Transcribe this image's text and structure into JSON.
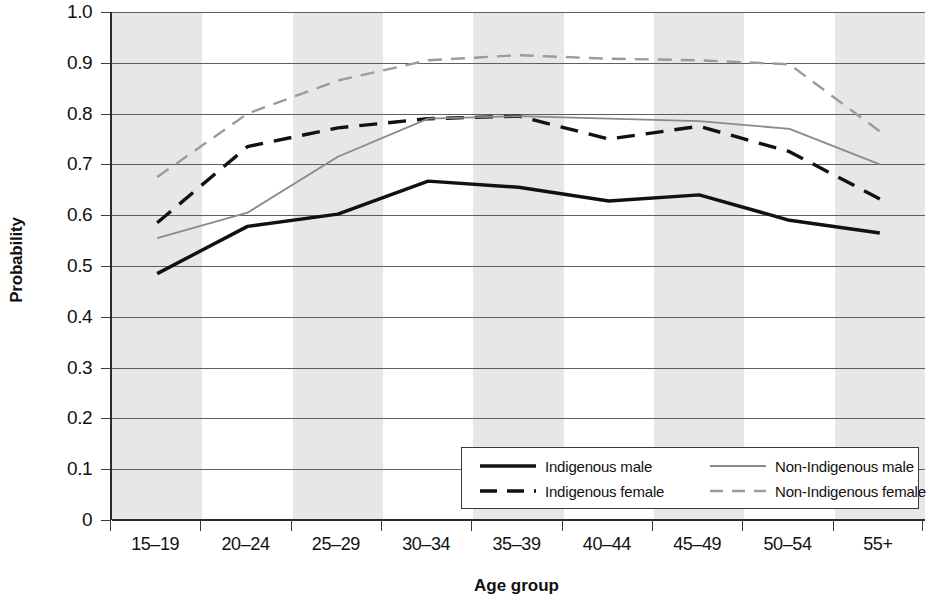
{
  "chart_data": {
    "type": "line",
    "title": "",
    "xlabel": "Age group",
    "ylabel": "Probability",
    "ylim": [
      0,
      1.0
    ],
    "ytick_labels": [
      "1.0",
      "0.9",
      "0.8",
      "0.7",
      "0.6",
      "0.5",
      "0.4",
      "0.3",
      "0.2",
      "0.1",
      "0"
    ],
    "ytick_values": [
      1.0,
      0.9,
      0.8,
      0.7,
      0.6,
      0.5,
      0.4,
      0.3,
      0.2,
      0.1,
      0
    ],
    "grid": true,
    "banded_background": true,
    "legend_position": "bottom-right",
    "categories": [
      "15–19",
      "20–24",
      "25–29",
      "30–34",
      "35–39",
      "40–44",
      "45–49",
      "50–54",
      "55+"
    ],
    "series": [
      {
        "name": "Indigenous male",
        "color": "#111111",
        "style": "solid",
        "width": 3.4,
        "values": [
          0.485,
          0.578,
          0.602,
          0.667,
          0.655,
          0.628,
          0.64,
          0.59,
          0.565
        ]
      },
      {
        "name": "Indigenous female",
        "color": "#111111",
        "style": "dashed",
        "width": 3.4,
        "values": [
          0.585,
          0.735,
          0.772,
          0.79,
          0.795,
          0.75,
          0.775,
          0.725,
          0.632
        ]
      },
      {
        "name": "Non-Indigenous male",
        "color": "#8a8a8a",
        "style": "solid",
        "width": 1.8,
        "values": [
          0.555,
          0.605,
          0.715,
          0.79,
          0.795,
          0.79,
          0.785,
          0.77,
          0.7
        ]
      },
      {
        "name": "Non-Indigenous female",
        "color": "#9b9b9b",
        "style": "dashed",
        "width": 2.4,
        "values": [
          0.675,
          0.8,
          0.865,
          0.905,
          0.915,
          0.908,
          0.905,
          0.897,
          0.765
        ]
      }
    ]
  },
  "legend": {
    "entries": [
      {
        "label": "Indigenous male"
      },
      {
        "label": "Non-Indigenous male"
      },
      {
        "label": "Indigenous female"
      },
      {
        "label": "Non-Indigenous female"
      }
    ]
  }
}
